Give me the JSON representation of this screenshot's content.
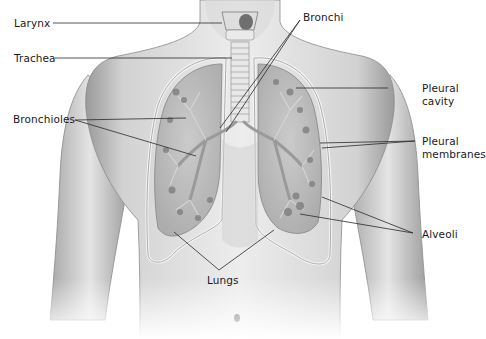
{
  "diagram": {
    "colors": {
      "background": "#ffffff",
      "skin_light": "#e6e6e6",
      "skin_mid": "#c9c9c9",
      "skin_dark": "#8e8e8e",
      "lung_fill": "#b8b8b8",
      "alveoli": "#7d7d7d",
      "leader_line": "#2a2a2a",
      "label_text": "#1a1a1a"
    },
    "labels": [
      {
        "id": "larynx",
        "text": "Larynx",
        "side": "left"
      },
      {
        "id": "trachea",
        "text": "Trachea",
        "side": "left"
      },
      {
        "id": "bronchioles",
        "text": "Bronchioles",
        "side": "left"
      },
      {
        "id": "bronchi",
        "text": "Bronchi",
        "side": "top"
      },
      {
        "id": "pleural-cavity",
        "text": "Pleural\ncavity",
        "side": "right"
      },
      {
        "id": "pleural-membranes",
        "text": "Pleural\nmembranes",
        "side": "right"
      },
      {
        "id": "alveoli",
        "text": "Alveoli",
        "side": "right"
      },
      {
        "id": "lungs",
        "text": "Lungs",
        "side": "bottom"
      }
    ]
  }
}
